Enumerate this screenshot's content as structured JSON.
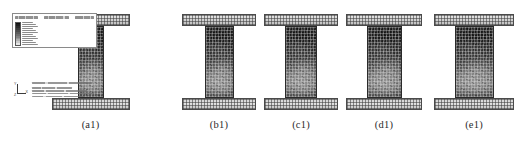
{
  "figure": {
    "type": "fea-contour-panel-series",
    "software": "Abaqus",
    "background_color": "#ffffff",
    "panel_count": 5
  },
  "panels": [
    {
      "caption": "(a1)",
      "left": 3,
      "width": 175,
      "specimen": {
        "web_width": 26,
        "web_height": 72,
        "web_top": 18,
        "flange_width": 78,
        "flange_height": 12,
        "center_x": 88,
        "has_legend": true,
        "has_footer": true
      }
    },
    {
      "caption": "(b1)",
      "left": 178,
      "width": 82,
      "specimen": {
        "web_width": 29,
        "web_height": 72,
        "web_top": 18,
        "flange_width": 74,
        "flange_height": 12,
        "center_x": 41,
        "has_legend": false,
        "has_footer": false
      }
    },
    {
      "caption": "(c1)",
      "left": 260,
      "width": 82,
      "specimen": {
        "web_width": 32,
        "web_height": 72,
        "web_top": 18,
        "flange_width": 74,
        "flange_height": 12,
        "center_x": 41,
        "has_legend": false,
        "has_footer": false
      }
    },
    {
      "caption": "(d1)",
      "left": 342,
      "width": 84,
      "specimen": {
        "web_width": 35,
        "web_height": 72,
        "web_top": 18,
        "flange_width": 76,
        "flange_height": 12,
        "center_x": 42,
        "has_legend": false,
        "has_footer": false
      }
    },
    {
      "caption": "(e1)",
      "left": 426,
      "width": 96,
      "specimen": {
        "web_width": 39,
        "web_height": 72,
        "web_top": 18,
        "flange_width": 80,
        "flange_height": 12,
        "center_x": 48,
        "has_legend": false,
        "has_footer": false
      }
    }
  ],
  "legend": {
    "visible": true,
    "panel": "(a1)",
    "band_count": 12,
    "colors": [
      "#101010",
      "#1e1e1e",
      "#2c2c2c",
      "#3b3b3b",
      "#4b4b4b",
      "#5c5c5c",
      "#6e6e6e",
      "#818181",
      "#979797",
      "#afafaf",
      "#c9c9c9",
      "#e6e6e6"
    ],
    "label_count": 12,
    "header_segments": 3
  },
  "viewport_footer": {
    "visible": true,
    "panel": "(a1)",
    "triad": {
      "axis_x_label": "X",
      "axis_y_label": "Y",
      "axis_z_label": "Z"
    },
    "text_line_count": 5
  }
}
